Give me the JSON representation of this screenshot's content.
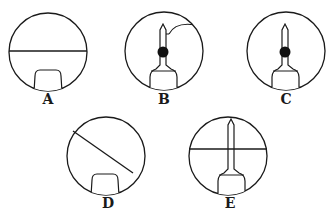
{
  "figure": {
    "panels": [
      {
        "id": "A",
        "label": "A",
        "cx": 48,
        "cy": 52,
        "r": 39,
        "line": "horizontal",
        "pin": false,
        "dot": false,
        "arc": false
      },
      {
        "id": "B",
        "label": "B",
        "cx": 164,
        "cy": 51,
        "r": 39,
        "line": "none",
        "pin": true,
        "dot": true,
        "arc": true
      },
      {
        "id": "C",
        "label": "C",
        "cx": 286,
        "cy": 51,
        "r": 39,
        "line": "none",
        "pin": true,
        "dot": true,
        "arc": false
      },
      {
        "id": "D",
        "label": "D",
        "cx": 106,
        "cy": 156,
        "r": 39,
        "line": "diagonal",
        "pin": false,
        "dot": false,
        "arc": false
      },
      {
        "id": "E",
        "label": "E",
        "cx": 228,
        "cy": 156,
        "r": 39,
        "line": "horizontal",
        "pin": true,
        "dot": false,
        "arc": false
      }
    ],
    "colors": {
      "stroke": "#1a1a1a",
      "background": "#ffffff"
    }
  }
}
